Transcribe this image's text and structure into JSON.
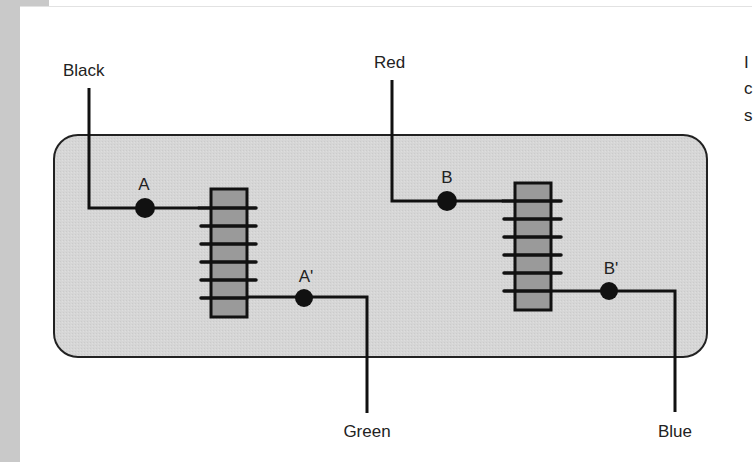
{
  "diagram": {
    "colors": {
      "panel_fill": "#d5d5d5",
      "core_fill": "#9a9a9a",
      "wire": "#111111",
      "sidebar": "#c9c9c9"
    },
    "wires": {
      "black": "Black",
      "red": "Red",
      "green": "Green",
      "blue": "Blue"
    },
    "terminals": {
      "a": "A",
      "a_prime": "A'",
      "b": "B",
      "b_prime": "B'"
    },
    "coils": [
      {
        "name": "coil-1",
        "input_terminal": "A",
        "output_terminal": "A'",
        "input_wire": "Black",
        "output_wire": "Green",
        "turns": 6
      },
      {
        "name": "coil-2",
        "input_terminal": "B",
        "output_terminal": "B'",
        "input_wire": "Red",
        "output_wire": "Blue",
        "turns": 6
      }
    ]
  },
  "clipped_text": {
    "line1": "I",
    "line2": "c",
    "line3": "s"
  }
}
